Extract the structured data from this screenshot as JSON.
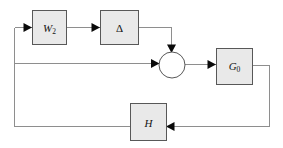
{
  "diagram": {
    "type": "control-system-block-diagram",
    "background_color": "#ffffff",
    "block_fill_color": "#e9e9e9",
    "block_border_color": "#585858",
    "wire_color": "#8e8e8e",
    "arrow_color": "#0a0a0a",
    "blocks": [
      {
        "id": "w2",
        "label": "W",
        "subscript": "2",
        "x": 32,
        "y": 10,
        "w": 34,
        "h": 34
      },
      {
        "id": "delta",
        "label": "Δ",
        "subscript": "",
        "x": 100,
        "y": 10,
        "w": 38,
        "h": 34
      },
      {
        "id": "g0",
        "label": "G",
        "subscript": "0",
        "x": 216,
        "y": 48,
        "w": 36,
        "h": 36
      },
      {
        "id": "h",
        "label": "H",
        "subscript": "",
        "x": 130,
        "y": 103,
        "w": 36,
        "h": 37
      }
    ],
    "summing_junction": {
      "id": "sum",
      "cx": 172,
      "cy": 65,
      "r": 13
    },
    "connections": [
      {
        "id": "feedback-to-w2",
        "from": "left-bus",
        "to": "w2"
      },
      {
        "id": "w2-to-delta",
        "from": "w2",
        "to": "delta"
      },
      {
        "id": "delta-to-sum",
        "from": "delta",
        "to": "sum"
      },
      {
        "id": "left-bus-to-sum",
        "from": "left-bus",
        "to": "sum"
      },
      {
        "id": "sum-to-g0",
        "from": "sum",
        "to": "g0"
      },
      {
        "id": "g0-to-h",
        "from": "g0",
        "to": "h"
      },
      {
        "id": "h-to-left-bus",
        "from": "h",
        "to": "left-bus"
      }
    ]
  }
}
